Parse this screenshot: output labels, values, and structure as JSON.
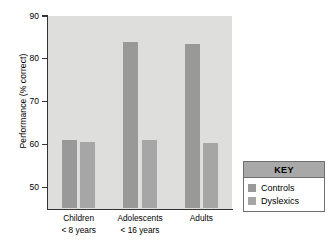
{
  "chart_data": {
    "type": "bar",
    "title": "",
    "xlabel": "",
    "ylabel": "Performance (% correct)",
    "ylim": [
      45,
      90
    ],
    "yticks": [
      90,
      80,
      70,
      60,
      50
    ],
    "grid": false,
    "legend_position": "right-bottom",
    "categories": [
      "Children\n< 8 years",
      "Adolescents\n< 16 years",
      "Adults"
    ],
    "category_lines": [
      {
        "line1": "Children",
        "line2": "< 8 years"
      },
      {
        "line1": "Adolescents",
        "line2": "< 16 years"
      },
      {
        "line1": "Adults",
        "line2": ""
      }
    ],
    "series": [
      {
        "name": "Controls",
        "color": "#999999",
        "values": [
          61.0,
          84.0,
          83.5
        ]
      },
      {
        "name": "Dyslexics",
        "color": "#a6a6a6",
        "values": [
          60.6,
          61.0,
          60.3
        ]
      }
    ]
  },
  "legend": {
    "title": "KEY",
    "items": [
      {
        "label": "Controls",
        "swatch": "controls"
      },
      {
        "label": "Dyslexics",
        "swatch": "dyslexics"
      }
    ]
  },
  "colors": {
    "plot_background": "#dededd",
    "axis": "#333333",
    "controls": "#999999",
    "dyslexics": "#a6a6a6",
    "legend_header": "#a8a8a8"
  }
}
